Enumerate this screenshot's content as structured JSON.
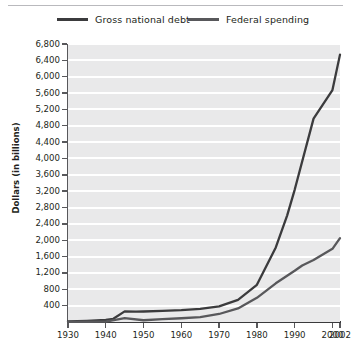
{
  "chart_data": {
    "type": "line",
    "title": "",
    "xlabel": "",
    "ylabel": "Dollars (in billions)",
    "xlim": [
      1930,
      2002
    ],
    "ylim": [
      0,
      6800
    ],
    "grid": true,
    "legend_position": "top",
    "x_tick_labels": [
      "1930",
      "1940",
      "1950",
      "1960",
      "1970",
      "1980",
      "1990",
      "2000",
      "2002"
    ],
    "x_ticks": [
      1930,
      1940,
      1950,
      1960,
      1970,
      1980,
      1990,
      2000,
      2002
    ],
    "y_ticks": [
      400,
      800,
      1200,
      1600,
      2000,
      2400,
      2800,
      3200,
      3600,
      4000,
      4400,
      4800,
      5200,
      5600,
      6000,
      6400,
      6800
    ],
    "y_tick_labels": [
      "400",
      "800",
      "1,200",
      "1,600",
      "2,000",
      "2,400",
      "2,800",
      "3,200",
      "3,600",
      "4,000",
      "4,400",
      "4,800",
      "5,200",
      "5,600",
      "6,000",
      "6,400",
      "6,800"
    ],
    "series": [
      {
        "name": "Gross national debt",
        "color": "#3b3b3d",
        "x": [
          1930,
          1935,
          1940,
          1942,
          1945,
          1948,
          1950,
          1955,
          1960,
          1965,
          1970,
          1975,
          1980,
          1985,
          1988,
          1990,
          1995,
          2000,
          2002
        ],
        "values": [
          16,
          29,
          51,
          79,
          260,
          252,
          257,
          274,
          291,
          322,
          381,
          542,
          909,
          1823,
          2602,
          3233,
          4974,
          5674,
          6540
        ]
      },
      {
        "name": "Federal spending",
        "color": "#58585b",
        "x": [
          1930,
          1935,
          1940,
          1945,
          1950,
          1955,
          1960,
          1965,
          1970,
          1975,
          1980,
          1985,
          1990,
          1992,
          1995,
          2000,
          2002
        ],
        "values": [
          3,
          6,
          9,
          93,
          43,
          68,
          92,
          118,
          196,
          332,
          591,
          946,
          1253,
          1382,
          1516,
          1789,
          2052
        ]
      }
    ]
  },
  "legend": {
    "items": [
      {
        "label": "Gross national debt",
        "color": "#3b3b3d"
      },
      {
        "label": "Federal spending",
        "color": "#58585b"
      }
    ]
  },
  "axis": {
    "y_title": "Dollars (in billions)"
  }
}
